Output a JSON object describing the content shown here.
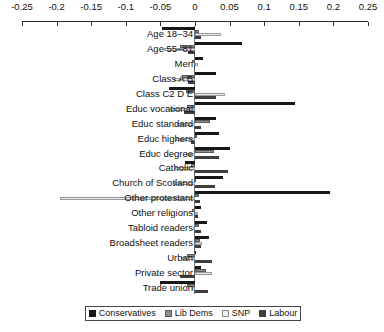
{
  "chart_data": {
    "type": "bar",
    "orientation": "horizontal",
    "title": "",
    "xlabel": "",
    "ylabel": "",
    "xlim": [
      -0.25,
      0.25
    ],
    "grid": false,
    "legend_position": "bottom",
    "tick_labels": [
      "-0.25",
      "-0.2",
      "-0.15",
      "-0.1",
      "-0.05",
      "0",
      "0.05",
      "0.1",
      "0.15",
      "0.2",
      "0.25"
    ],
    "tick_values": [
      -0.25,
      -0.2,
      -0.15,
      -0.1,
      -0.05,
      0,
      0.05,
      0.1,
      0.15,
      0.2,
      0.25
    ],
    "categories": [
      "Age 18–34",
      "Age 55–81",
      "Men",
      "Class A B",
      "Class C2 D E",
      "Educ vocational",
      "Educ standard",
      "Educ highers",
      "Educ degree",
      "Catholic",
      "Church of Scotland",
      "Other protestant",
      "Other religions",
      "Tabloid readers",
      "Broadsheet readers",
      "Urban",
      "Private sector",
      "Trade union"
    ],
    "series": [
      {
        "name": "Conservatives",
        "color": "#171717",
        "values": [
          -0.047,
          0.068,
          0.012,
          0.03,
          -0.038,
          0.145,
          0.03,
          0.035,
          0.05,
          -0.015,
          0.04,
          0.195,
          0.009,
          0.017,
          0.02,
          0.002,
          0.009,
          -0.05
        ]
      },
      {
        "name": "Lib Dems",
        "color": "#8d8d8d",
        "values": [
          0.006,
          -0.022,
          -0.004,
          -0.019,
          -0.013,
          -0.012,
          0.022,
          0.003,
          0.028,
          -0.006,
          -0.002,
          0.006,
          -0.005,
          0.006,
          0.007,
          -0.012,
          0.016,
          -0.012
        ]
      },
      {
        "name": "SNP",
        "color": "#e6e6e6",
        "values": [
          0.037,
          -0.045,
          0.005,
          -0.03,
          0.044,
          -0.036,
          -0.026,
          -0.027,
          -0.013,
          -0.029,
          -0.03,
          -0.195,
          0.005,
          -0.003,
          0.01,
          -0.02,
          0.025,
          -0.004
        ]
      },
      {
        "name": "Labour",
        "color": "#3e3e3e",
        "values": [
          0.009,
          -0.01,
          -0.001,
          -0.01,
          0.03,
          -0.016,
          0.009,
          -0.006,
          0.035,
          0.047,
          0.029,
          0.007,
          0.004,
          0.008,
          0.009,
          0.025,
          -0.022,
          0.019
        ]
      }
    ]
  },
  "legend": {
    "items": [
      {
        "label": "Conservatives"
      },
      {
        "label": "Lib Dems"
      },
      {
        "label": "SNP"
      },
      {
        "label": "Labour"
      }
    ]
  }
}
